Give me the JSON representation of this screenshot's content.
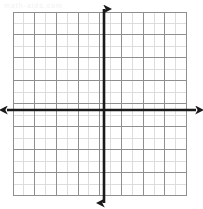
{
  "page": {
    "background_color": "#ffffff",
    "width": 203,
    "height": 209
  },
  "watermark": {
    "text": "math-aids.com",
    "color": "#f2f2f2",
    "visible": true
  },
  "chart_data": {
    "type": "scatter",
    "title": "",
    "subtitle": "",
    "xlabel": "",
    "ylabel": "",
    "x": [],
    "y": [],
    "series": [],
    "annotations": [],
    "legend": {
      "visible": false,
      "position": "none",
      "entries": []
    },
    "grid": {
      "visible": true,
      "columns": 16,
      "rows": 16,
      "cell_size_px": 10.85,
      "minor_color": "#d9d9d9",
      "major_color": "#8f8f8f",
      "major_every": 2,
      "left_px": 13,
      "top_px": 12,
      "right_px": 186.6,
      "bottom_px": 195.6
    },
    "axes": {
      "visible": true,
      "color": "#1a1a1a",
      "line_width_px": 2.6,
      "arrowheads": true,
      "origin_px": {
        "x": 104,
        "y": 110
      },
      "xlim": [
        -8,
        8
      ],
      "ylim": [
        -8,
        8
      ],
      "x_tick_labels": [],
      "y_tick_labels": [],
      "x_axis_start_px": 7,
      "x_axis_end_px": 196,
      "y_axis_start_px": 9,
      "y_axis_end_px": 203
    }
  }
}
